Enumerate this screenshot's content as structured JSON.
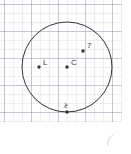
{
  "figure": {
    "background_color": "#ffffff",
    "stroke_color": "#333338",
    "grid_color": "#8c94ac",
    "width": 131,
    "height": 154
  },
  "grid": {
    "minor_spacing_px": 9,
    "major_spacing_px": 27,
    "visible": true
  },
  "chart_data": {
    "type": "scatter",
    "xlabel": "",
    "ylabel": "",
    "xlim": [
      0,
      131
    ],
    "ylim": [
      0,
      154
    ],
    "grid": true,
    "legend": "none",
    "shapes": [
      {
        "kind": "circle",
        "name": "main-circle",
        "center_x": 67,
        "center_y": 67,
        "radius": 45,
        "stroke": "#333338",
        "stroke_width": 1,
        "fill": "none"
      }
    ],
    "points": [
      {
        "id": "p1",
        "label": "L",
        "x": 39,
        "y": 67,
        "label_dx": 4,
        "label_dy": -8,
        "label_rotation": 0,
        "marker": "dot",
        "color": "#333338"
      },
      {
        "id": "p2",
        "label": "C",
        "x": 67,
        "y": 67,
        "label_dx": 4,
        "label_dy": -8,
        "label_rotation": 0,
        "marker": "dot",
        "color": "#333338"
      },
      {
        "id": "p3",
        "label": "7",
        "x": 83,
        "y": 51,
        "label_dx": 4,
        "label_dy": -9,
        "label_rotation": 0,
        "marker": "dot",
        "color": "#333338"
      },
      {
        "id": "p4",
        "label": "२",
        "x": 67,
        "y": 112,
        "label_dx": -3,
        "label_dy": -11,
        "label_rotation": 180,
        "marker": "dot",
        "color": "#333338"
      }
    ],
    "annotations": [
      {
        "id": "stray",
        "text": "",
        "x": 111,
        "y": 141,
        "note": "faint stray pencil mark"
      }
    ]
  }
}
